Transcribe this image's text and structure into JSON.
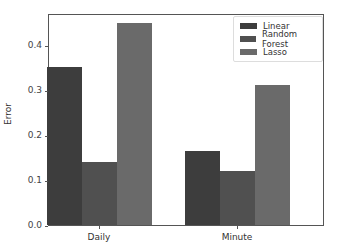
{
  "chart_data": {
    "type": "bar",
    "title": "",
    "xlabel": "",
    "ylabel": "Error",
    "categories": [
      "Daily",
      "Minute"
    ],
    "series": [
      {
        "name": "Linear",
        "color": "#3d3d3d",
        "values": [
          0.351,
          0.164
        ]
      },
      {
        "name": "Random Forest",
        "color": "#505050",
        "values": [
          0.139,
          0.12
        ]
      },
      {
        "name": "Lasso",
        "color": "#6a6a6a",
        "values": [
          0.449,
          0.311
        ]
      }
    ],
    "ylim": [
      0.0,
      0.47
    ],
    "yticks": [
      "0.0",
      "0.1",
      "0.2",
      "0.3",
      "0.4"
    ],
    "grid": false,
    "legend_position": "upper right"
  }
}
